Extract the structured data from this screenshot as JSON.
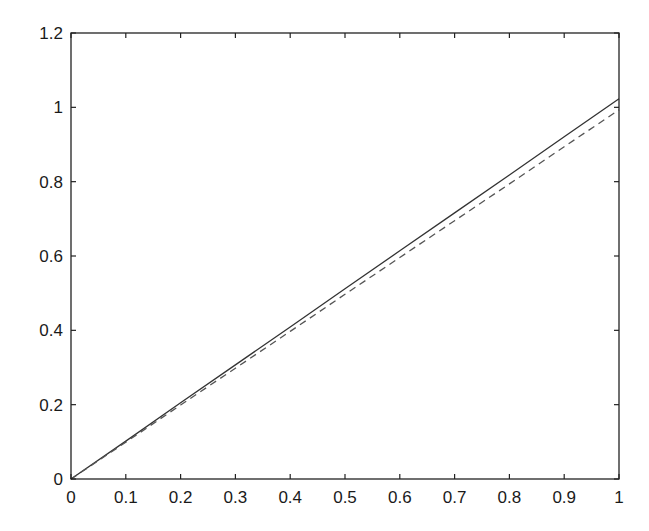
{
  "chart_data": {
    "type": "line",
    "title": "",
    "xlabel": "",
    "ylabel": "",
    "xlim": [
      0,
      1
    ],
    "ylim": [
      0,
      1.2
    ],
    "grid": false,
    "legend": null,
    "x_ticks": [
      "0",
      "0.1",
      "0.2",
      "0.3",
      "0.4",
      "0.5",
      "0.6",
      "0.7",
      "0.8",
      "0.9",
      "1"
    ],
    "y_ticks": [
      "0",
      "0.2",
      "0.4",
      "0.6",
      "0.8",
      "1",
      "1.2"
    ],
    "series": [
      {
        "name": "solid",
        "style": "solid",
        "color": "#333333",
        "x": [
          0,
          0.1,
          0.2,
          0.3,
          0.4,
          0.5,
          0.6,
          0.7,
          0.8,
          0.9,
          1.0
        ],
        "y": [
          0,
          0.102,
          0.205,
          0.307,
          0.409,
          0.512,
          0.614,
          0.716,
          0.818,
          0.921,
          1.023
        ]
      },
      {
        "name": "dashed",
        "style": "dashed",
        "color": "#555555",
        "x": [
          0,
          0.1,
          0.2,
          0.3,
          0.4,
          0.5,
          0.6,
          0.7,
          0.8,
          0.9,
          1.0
        ],
        "y": [
          0,
          0.099,
          0.199,
          0.298,
          0.397,
          0.497,
          0.596,
          0.695,
          0.794,
          0.894,
          0.993
        ]
      }
    ]
  },
  "plot_box": {
    "left": 71,
    "top": 33,
    "right": 619,
    "bottom": 479
  }
}
